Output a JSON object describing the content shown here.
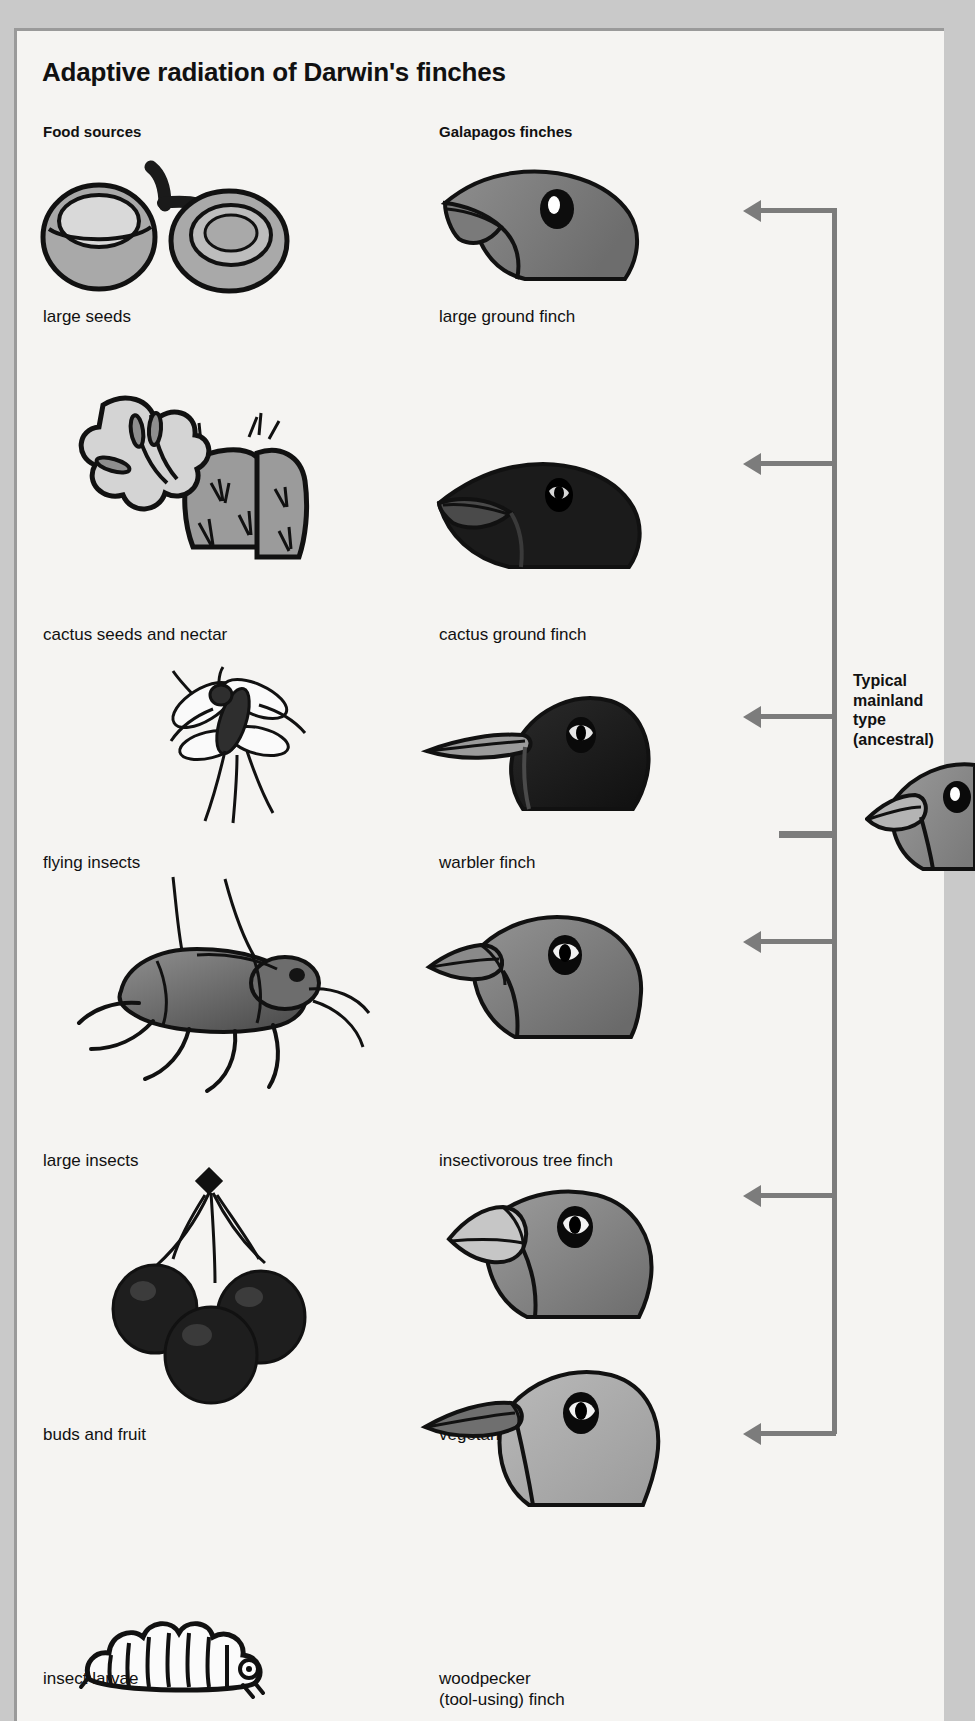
{
  "figure": {
    "title": "Adaptive radiation of Darwin's finches",
    "columns": {
      "food": "Food sources",
      "finch": "Galapagos finches"
    },
    "mainland": {
      "label": "Typical\nmainland\ntype\n(ancestral)",
      "icon": "ancestral-finch-head-icon"
    },
    "accent_color": "#7c7c7c",
    "panel_color": "#f5f4f2",
    "page_color": "#c9c9c9",
    "rows": [
      {
        "food_label": "large seeds",
        "finch_label": "large ground finch",
        "food_icon": "large-seeds-icon",
        "finch_icon": "large-ground-finch-head-icon"
      },
      {
        "food_label": "cactus seeds and nectar",
        "finch_label": "cactus ground finch",
        "food_icon": "cactus-flower-icon",
        "finch_icon": "cactus-ground-finch-head-icon"
      },
      {
        "food_label": "flying insects",
        "finch_label": "warbler finch",
        "food_icon": "flying-insect-icon",
        "finch_icon": "warbler-finch-head-icon"
      },
      {
        "food_label": "large insects",
        "finch_label": "insectivorous tree finch",
        "food_icon": "large-beetle-icon",
        "finch_icon": "insectivorous-tree-finch-head-icon"
      },
      {
        "food_label": "buds and fruit",
        "finch_label": "vegetarian tree finch",
        "food_icon": "buds-and-fruit-icon",
        "finch_icon": "vegetarian-tree-finch-head-icon"
      },
      {
        "food_label": "insect larvae",
        "finch_label": "woodpecker\n(tool-using) finch",
        "food_icon": "caterpillar-larva-icon",
        "finch_icon": "woodpecker-finch-head-icon"
      }
    ]
  }
}
